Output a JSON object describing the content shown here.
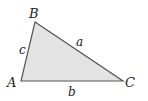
{
  "figure": {
    "colors": {
      "fill": "#e3e3e3",
      "stroke": "#555555",
      "text": "#222222"
    },
    "vertices": [
      {
        "label": "A",
        "x": 21,
        "y": 81
      },
      {
        "label": "B",
        "x": 35,
        "y": 22
      },
      {
        "label": "C",
        "x": 123,
        "y": 81
      }
    ],
    "sides": [
      {
        "label": "a",
        "between": "B-C"
      },
      {
        "label": "b",
        "between": "A-C"
      },
      {
        "label": "c",
        "between": "A-B"
      }
    ]
  }
}
